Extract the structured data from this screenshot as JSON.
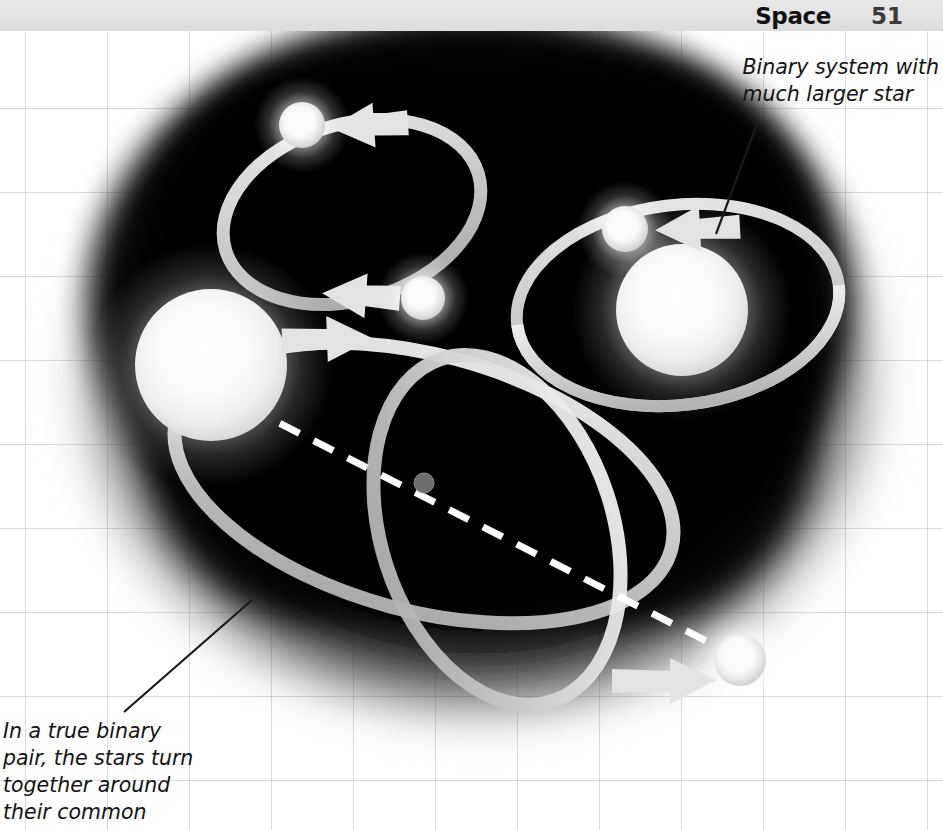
{
  "header": {
    "title": "Space",
    "page_number": "51"
  },
  "annotations": {
    "top_right": {
      "text": "Binary system with\nmuch larger star",
      "leader_from": [
        757,
        124
      ],
      "leader_to": [
        716,
        234
      ]
    },
    "bottom_left": {
      "text": "In a true binary\npair, the stars turn\ntogether around\ntheir common",
      "leader_from": [
        124,
        712
      ],
      "leader_to": [
        250,
        601
      ]
    }
  },
  "diagram": {
    "background_color": "#000000",
    "glow_color": "#ffffff",
    "orbit_color": "#d9d9d9",
    "systems": [
      {
        "id": "equal-mass-binary",
        "label": "Two similar stars orbiting a shared ellipse",
        "orbit": {
          "cx": 352,
          "cy": 212,
          "rx": 132,
          "ry": 88,
          "rotation": -17
        },
        "stars": [
          {
            "name": "star-upper-left",
            "cx": 302,
            "cy": 125,
            "r": 23,
            "kind": "small"
          },
          {
            "name": "star-lower-right",
            "cx": 423,
            "cy": 298,
            "r": 22,
            "kind": "small"
          }
        ],
        "arrows": [
          "counter-clockwise-top",
          "counter-clockwise-bottom"
        ]
      },
      {
        "id": "unequal-mass-binary",
        "label": "Binary system with much larger star",
        "orbit": {
          "cx": 678,
          "cy": 305,
          "rx": 160,
          "ry": 100,
          "rotation": -8
        },
        "stars": [
          {
            "name": "star-large-primary",
            "cx": 682,
            "cy": 310,
            "r": 66,
            "kind": "large"
          },
          {
            "name": "star-small-companion",
            "cx": 625,
            "cy": 229,
            "r": 23,
            "kind": "small"
          }
        ],
        "arrows": [
          "leftward-arrow-at-top"
        ]
      },
      {
        "id": "true-binary-pair",
        "label": "In a true binary pair, the stars turn together around their common centre of mass",
        "barycentre": {
          "cx": 424,
          "cy": 483,
          "r": 9,
          "color": "#6f6f6f"
        },
        "orbits": [
          {
            "name": "orbit-large-star",
            "cx": 424,
            "cy": 483,
            "rx": 256,
            "ry": 128,
            "rotation": 16
          },
          {
            "name": "orbit-small-star",
            "cx": 497,
            "cy": 530,
            "rx": 180,
            "ry": 116,
            "rotation": 72
          }
        ],
        "stars": [
          {
            "name": "star-large-left",
            "cx": 211,
            "cy": 365,
            "r": 76,
            "kind": "large"
          },
          {
            "name": "star-small-lower-right",
            "cx": 740,
            "cy": 660,
            "r": 26,
            "kind": "small"
          }
        ],
        "connector": {
          "name": "centre-of-mass-line",
          "style": "dashed",
          "from": [
            246,
            406
          ],
          "to": [
            725,
            650
          ],
          "color": "#ffffff"
        },
        "arrows": [
          "arrow-to-large-star",
          "arrow-to-small-star"
        ]
      }
    ]
  }
}
